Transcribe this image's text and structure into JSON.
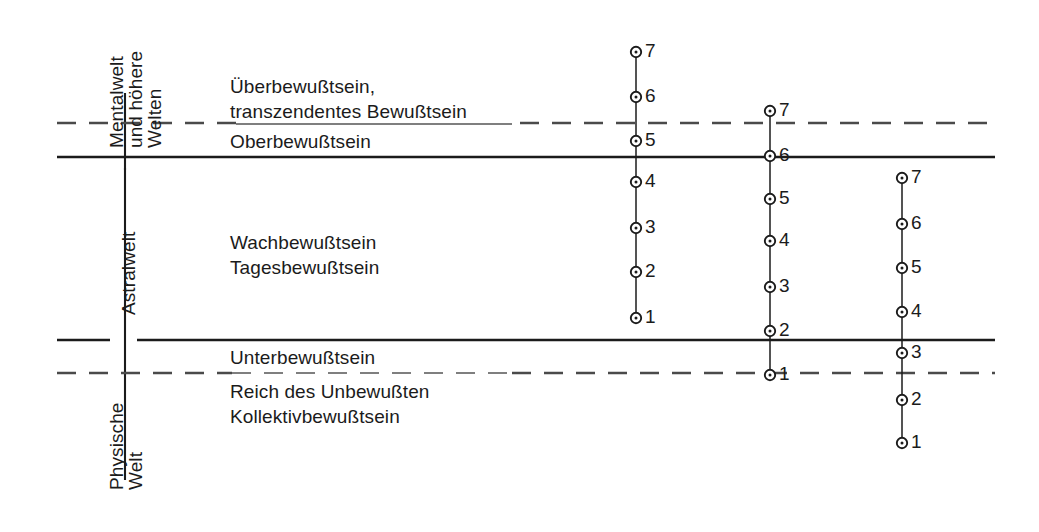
{
  "figure": {
    "type": "diagram",
    "width": 1039,
    "height": 532,
    "background": "#ffffff",
    "line_color": "#1b1b1b",
    "text_color": "#1b1b1b"
  },
  "world_labels": [
    {
      "id": "mental",
      "text": "Mentalwelt",
      "text2": "und höhere",
      "text3": "Welten"
    },
    {
      "id": "astral",
      "text": "Astralwelt"
    },
    {
      "id": "physical",
      "text": "Physische",
      "text2": "Welt"
    }
  ],
  "consciousness_labels": [
    {
      "id": "ueberbewusstsein",
      "line1": "Überbewußtsein,",
      "line2": "transzendentes Bewußtsein"
    },
    {
      "id": "oberbewusstsein",
      "line1": "Oberbewußtsein"
    },
    {
      "id": "wachbewusstsein",
      "line1": "Wachbewußtsein",
      "line2": "Tagesbewußtsein"
    },
    {
      "id": "unterbewusstsein",
      "line1": "Unterbewußtsein"
    },
    {
      "id": "unbewusstes",
      "line1": "Reich des Unbewußten",
      "line2": "Kollektivbewußtsein"
    }
  ],
  "boundaries": [
    {
      "id": "mental-upper-dashed",
      "style": "dashed",
      "y": 123
    },
    {
      "id": "mental-astral-solid",
      "style": "solid",
      "y": 157
    },
    {
      "id": "astral-lower-solid",
      "style": "solid",
      "y": 340
    },
    {
      "id": "physical-dashed",
      "style": "dashed",
      "y": 373
    }
  ],
  "scales": [
    {
      "id": "scale-1",
      "x": 636,
      "points": [
        {
          "label": "7",
          "y": 52
        },
        {
          "label": "6",
          "y": 97
        },
        {
          "label": "5",
          "y": 141
        },
        {
          "label": "4",
          "y": 182
        },
        {
          "label": "3",
          "y": 228
        },
        {
          "label": "2",
          "y": 272
        },
        {
          "label": "1",
          "y": 318
        }
      ]
    },
    {
      "id": "scale-2",
      "x": 770,
      "points": [
        {
          "label": "7",
          "y": 111
        },
        {
          "label": "6",
          "y": 156
        },
        {
          "label": "5",
          "y": 199
        },
        {
          "label": "4",
          "y": 241
        },
        {
          "label": "3",
          "y": 287
        },
        {
          "label": "2",
          "y": 331
        },
        {
          "label": "1",
          "y": 375
        }
      ]
    },
    {
      "id": "scale-3",
      "x": 902,
      "points": [
        {
          "label": "7",
          "y": 178
        },
        {
          "label": "6",
          "y": 224
        },
        {
          "label": "5",
          "y": 268
        },
        {
          "label": "4",
          "y": 312
        },
        {
          "label": "3",
          "y": 353
        },
        {
          "label": "2",
          "y": 400
        },
        {
          "label": "1",
          "y": 443
        }
      ]
    }
  ]
}
